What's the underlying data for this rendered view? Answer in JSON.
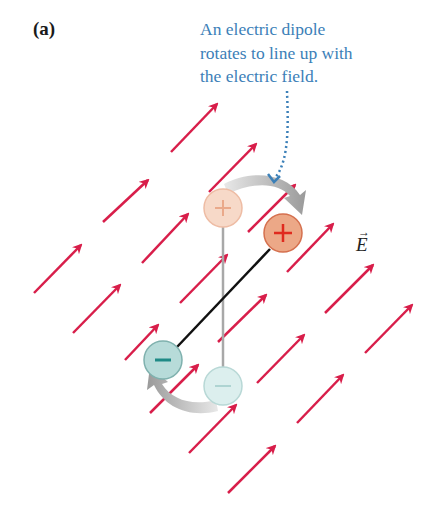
{
  "figure": {
    "panel_label": "(a)",
    "caption_lines": [
      "An electric dipole",
      "rotates to line up with",
      "the electric field."
    ],
    "field_symbol": "E",
    "field_vector_mark": "→"
  },
  "colors": {
    "field_arrow": "#d81e4a",
    "caption": "#3c80b8",
    "positive_charge_fill": "#eca887",
    "positive_charge_stroke": "#d5704e",
    "positive_sign": "#e02a1e",
    "positive_faded_fill": "#f7d9c8",
    "negative_charge_fill": "#b7dbd9",
    "negative_charge_stroke": "#7fb1ae",
    "negative_sign": "#1f8a86",
    "negative_faded_fill": "#dcefee",
    "rotation_arrow": "#b0b0b0",
    "dipole_rod": "#111111",
    "initial_rod": "#a8a8a8"
  },
  "dipole": {
    "initial": {
      "positive": {
        "x": 223,
        "y": 208
      },
      "negative": {
        "x": 223,
        "y": 386
      }
    },
    "final": {
      "positive": {
        "x": 283,
        "y": 233
      },
      "negative": {
        "x": 163,
        "y": 360
      }
    },
    "positive_sign": "+",
    "negative_sign": "−"
  },
  "field_arrows": [
    [
      171,
      152,
      217,
      104
    ],
    [
      209,
      192,
      256,
      144
    ],
    [
      103,
      222,
      148,
      180
    ],
    [
      34,
      293,
      81,
      245
    ],
    [
      142,
      263,
      188,
      214
    ],
    [
      248,
      232,
      295,
      185
    ],
    [
      73,
      333,
      120,
      285
    ],
    [
      180,
      303,
      227,
      255
    ],
    [
      287,
      272,
      333,
      224
    ],
    [
      125,
      360,
      158,
      325
    ],
    [
      218,
      342,
      266,
      295
    ],
    [
      325,
      313,
      373,
      265
    ],
    [
      150,
      413,
      198,
      365
    ],
    [
      257,
      383,
      304,
      335
    ],
    [
      365,
      353,
      412,
      305
    ],
    [
      189,
      453,
      236,
      405
    ],
    [
      297,
      423,
      343,
      375
    ],
    [
      228,
      493,
      275,
      446
    ]
  ]
}
